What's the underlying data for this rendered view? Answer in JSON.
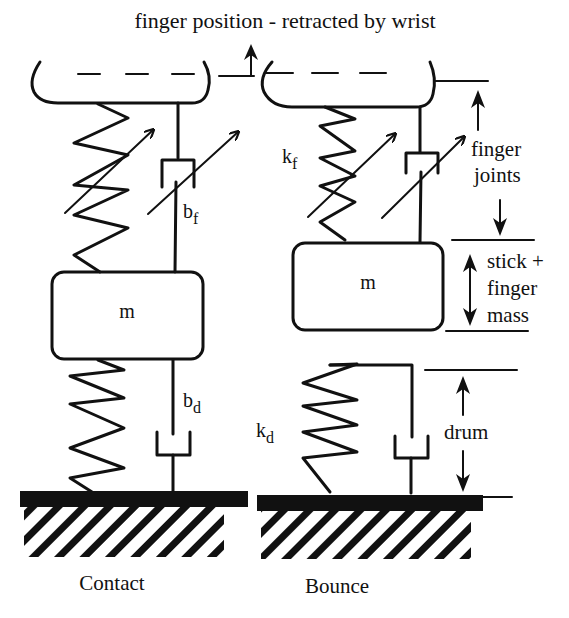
{
  "title": "finger position - retracted by wrist",
  "panels": [
    {
      "id": "contact",
      "caption": "Contact",
      "mass_label": "m",
      "finger_damper_label": "b",
      "finger_damper_sub": "f",
      "drum_damper_label": "b",
      "drum_damper_sub": "d"
    },
    {
      "id": "bounce",
      "caption": "Bounce",
      "mass_label": "m",
      "finger_spring_label": "k",
      "finger_spring_sub": "f",
      "drum_spring_label": "k",
      "drum_spring_sub": "d"
    }
  ],
  "annotations": {
    "finger_joints": [
      "finger",
      "joints"
    ],
    "stick_mass": [
      "stick +",
      "finger",
      "mass"
    ],
    "drum": "drum"
  },
  "colors": {
    "ink": "#111111",
    "background": "#ffffff"
  }
}
